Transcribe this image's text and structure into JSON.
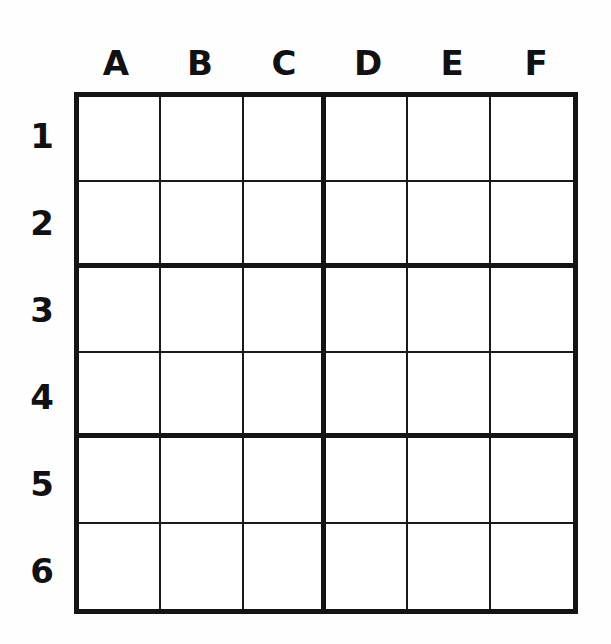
{
  "page": {
    "background_color": "#fefefe",
    "line_color": "#141414",
    "thin_line_color": "#1a1a1a",
    "cell_fill": "#ffffff"
  },
  "grid": {
    "columns": 6,
    "rows": 6,
    "block_columns": 3,
    "block_rows": 2,
    "column_headers": [
      "A",
      "B",
      "C",
      "D",
      "E",
      "F"
    ],
    "row_labels": [
      "1",
      "2",
      "3",
      "4",
      "5",
      "6"
    ],
    "cells": [
      [
        "",
        "",
        "",
        "",
        "",
        ""
      ],
      [
        "",
        "",
        "",
        "",
        "",
        ""
      ],
      [
        "",
        "",
        "",
        "",
        "",
        ""
      ],
      [
        "",
        "",
        "",
        "",
        "",
        ""
      ],
      [
        "",
        "",
        "",
        "",
        "",
        ""
      ],
      [
        "",
        "",
        "",
        "",
        "",
        ""
      ]
    ]
  }
}
